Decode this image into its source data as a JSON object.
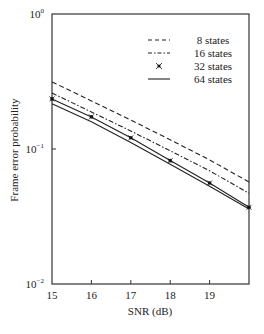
{
  "chart_data": {
    "type": "line",
    "title": "",
    "xlabel": "SNR (dB)",
    "ylabel": "Frame error probability",
    "yscale": "log",
    "xlim": [
      15,
      20
    ],
    "ylim": [
      0.01,
      1
    ],
    "x_ticks": [
      15,
      16,
      17,
      18,
      19
    ],
    "y_ticks": [
      {
        "value": 1,
        "base": "10",
        "exp": "0"
      },
      {
        "value": 0.1,
        "base": "10",
        "exp": "−1"
      },
      {
        "value": 0.01,
        "base": "10",
        "exp": "−2"
      }
    ],
    "grid": false,
    "legend_position": "top-right",
    "x": [
      15,
      16,
      17,
      18,
      19,
      20
    ],
    "series": [
      {
        "name": "8 states",
        "style": "dashed",
        "marker": "none",
        "values": [
          0.314,
          0.227,
          0.164,
          0.117,
          0.083,
          0.057
        ]
      },
      {
        "name": "16 states",
        "style": "dash-dot",
        "marker": "none",
        "values": [
          0.26,
          0.188,
          0.136,
          0.097,
          0.069,
          0.047
        ]
      },
      {
        "name": "32 states",
        "style": "solid",
        "marker": "star",
        "values": [
          0.235,
          0.173,
          0.121,
          0.082,
          0.056,
          0.037
        ]
      },
      {
        "name": "64 states",
        "style": "solid",
        "marker": "none",
        "values": [
          0.216,
          0.159,
          0.112,
          0.077,
          0.053,
          0.036
        ]
      }
    ]
  }
}
